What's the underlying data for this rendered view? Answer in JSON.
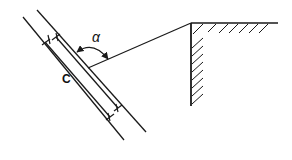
{
  "diagram": {
    "labels": {
      "angle": "α",
      "member": "C"
    },
    "colors": {
      "stroke": "#1a1a1a",
      "background": "#ffffff"
    }
  }
}
